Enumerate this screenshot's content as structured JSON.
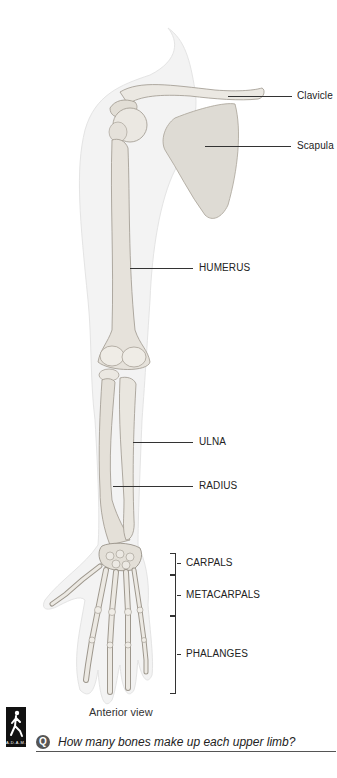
{
  "figure": {
    "title_view": "Anterior view",
    "labels": {
      "clavicle": "Clavicle",
      "scapula": "Scapula",
      "humerus": "HUMERUS",
      "ulna": "ULNA",
      "radius": "RADIUS",
      "carpals": "CARPALS",
      "metacarpals": "METACARPALS",
      "phalanges": "PHALANGES"
    },
    "colors": {
      "bone": "#e9e6df",
      "bone_shade": "#b9b4aa",
      "skin": "#f1f1f1",
      "ink": "#222222"
    }
  },
  "footer": {
    "logo_text": "A.D.A.M.",
    "question_icon": "Q",
    "question": "How many bones make up each upper limb?"
  }
}
